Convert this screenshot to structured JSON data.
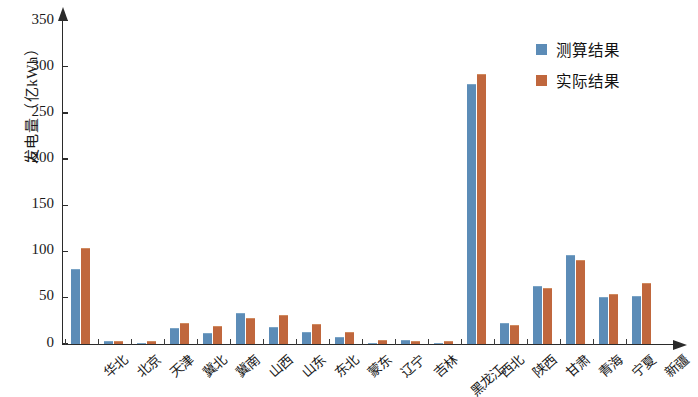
{
  "chart_data": {
    "type": "bar",
    "title": "",
    "xlabel": "",
    "ylabel": "发电量（亿kWh）",
    "ylim": [
      0,
      350
    ],
    "yticks": [
      0,
      50,
      100,
      150,
      200,
      250,
      300,
      350
    ],
    "grid": false,
    "legend_position": "top-right",
    "categories": [
      "华北",
      "北京",
      "天津",
      "冀北",
      "冀南",
      "山西",
      "山东",
      "东北",
      "蒙东",
      "辽宁",
      "吉林",
      "黑龙江",
      "西北",
      "陕西",
      "甘肃",
      "青海",
      "宁夏",
      "新疆"
    ],
    "series": [
      {
        "name": "测算结果",
        "color": "#5c8cb7",
        "values": [
          80,
          1,
          0,
          16,
          10,
          32,
          17,
          12,
          6,
          0,
          3,
          0,
          280,
          21,
          61,
          95,
          49,
          51
        ]
      },
      {
        "name": "实际结果",
        "color": "#c0673d",
        "values": [
          102,
          1,
          2,
          21,
          18,
          27,
          30,
          20,
          11,
          3,
          2,
          1,
          291,
          19,
          59,
          89,
          53,
          65
        ]
      }
    ]
  },
  "axis": {
    "y_label": "发电量（亿kWh）",
    "y_tick_labels": [
      "0",
      "50",
      "100",
      "150",
      "200",
      "250",
      "300",
      "350"
    ]
  },
  "legend": {
    "items": [
      {
        "label": "测算结果",
        "color": "#5c8cb7"
      },
      {
        "label": "实际结果",
        "color": "#c0673d"
      }
    ]
  }
}
